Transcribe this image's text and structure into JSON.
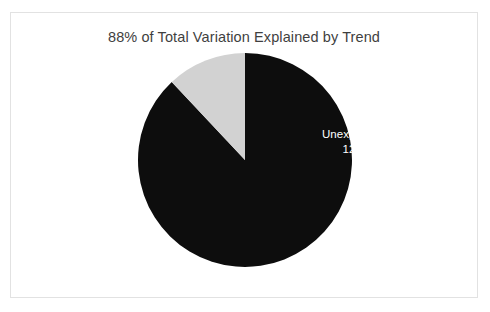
{
  "chart_data": {
    "type": "pie",
    "title": "88% of Total Variation Explained by Trend",
    "xlabel": "",
    "ylabel": "",
    "legend_position": "none",
    "grid": false,
    "start_angle_deg": 0,
    "direction": "counterclockwise",
    "categories": [
      "Explained",
      "Unexplained"
    ],
    "values": [
      88,
      12
    ],
    "value_unit": "%",
    "slices": [
      {
        "label": "Explained",
        "value": 88,
        "value_label": "88%",
        "color": "#0d0d0d",
        "label_color": "#ffffff",
        "start_deg": 0,
        "sweep_deg": 316.8
      },
      {
        "label": "Unexplained",
        "value": 12,
        "value_label": "12%",
        "color": "#d2d2d2",
        "label_color": "#ffffff",
        "start_deg": 316.8,
        "sweep_deg": 43.2
      }
    ],
    "colors": {
      "explained": "#0d0d0d",
      "unexplained": "#d2d2d2",
      "title_text": "#3f3f3f",
      "plot_background": "#ffffff",
      "frame_border": "#e2e2e2"
    }
  },
  "labels": {
    "unexplained": {
      "name": "Unexplained",
      "value": "12%"
    },
    "explained": {
      "name": "Explained",
      "value": "88%"
    }
  }
}
